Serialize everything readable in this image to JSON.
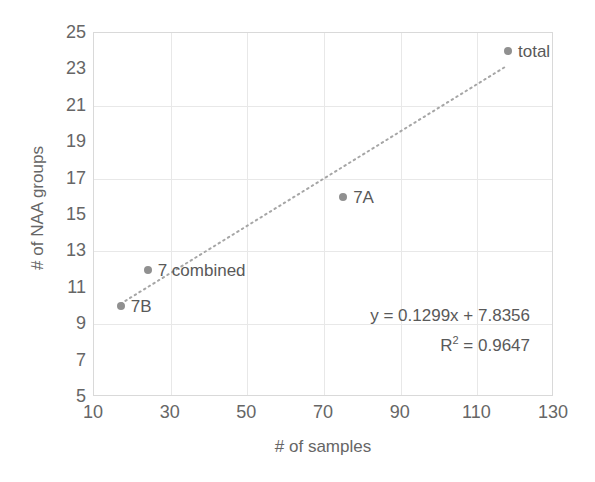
{
  "chart_data": {
    "type": "scatter",
    "title": "",
    "xlabel": "# of samples",
    "ylabel": "# of NAA groups",
    "xlim": [
      10,
      130
    ],
    "ylim": [
      5,
      25
    ],
    "xticks": [
      10,
      30,
      50,
      70,
      90,
      110,
      130
    ],
    "yticks": [
      5,
      7,
      9,
      11,
      13,
      15,
      17,
      19,
      21,
      23,
      25
    ],
    "grid": true,
    "legend": "none",
    "points": [
      {
        "label": "7B",
        "x": 17,
        "y": 10
      },
      {
        "label": "7 combined",
        "x": 24,
        "y": 12
      },
      {
        "label": "7A",
        "x": 75,
        "y": 16
      },
      {
        "label": "total",
        "x": 118,
        "y": 24
      }
    ],
    "trendline": {
      "type": "linear",
      "style": "dotted",
      "slope": 0.1299,
      "intercept": 7.8356,
      "r_squared": 0.9647,
      "x_start": 17,
      "x_end": 118
    },
    "annotations": {
      "equation": "y = 0.1299x + 7.8356",
      "r_squared_prefix": "R",
      "r_squared_exponent": "2",
      "r_squared_value": " = 0.9647"
    },
    "colors": {
      "marker": "#909090",
      "trendline": "#a6a6a6",
      "gridline": "#e8e8e8",
      "axis": "#d9d9d9",
      "text": "#595959",
      "tick_text": "#666666",
      "background": "#ffffff"
    }
  }
}
